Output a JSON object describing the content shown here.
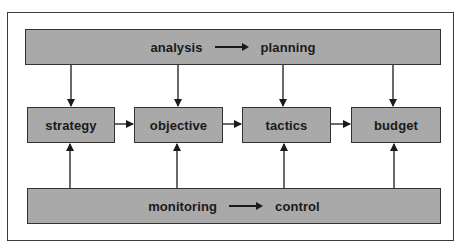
{
  "diagram": {
    "top_bar": {
      "from": "analysis",
      "to": "planning"
    },
    "boxes": [
      {
        "label": "strategy"
      },
      {
        "label": "objective"
      },
      {
        "label": "tactics"
      },
      {
        "label": "budget"
      }
    ],
    "bottom_bar": {
      "from": "monitoring",
      "to": "control"
    },
    "colors": {
      "fill": "#a9a9a9",
      "stroke": "#333333",
      "text": "#1a1a1a"
    }
  }
}
